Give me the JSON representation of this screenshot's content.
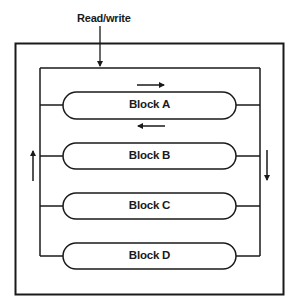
{
  "diagram": {
    "title_label": "Read/write",
    "blocks": [
      {
        "label": "Block A"
      },
      {
        "label": "Block B"
      },
      {
        "label": "Block C"
      },
      {
        "label": "Block D"
      }
    ],
    "arrows": [
      {
        "name": "read-write-arrow",
        "direction": "down"
      },
      {
        "name": "flow-right-arrow",
        "direction": "right"
      },
      {
        "name": "flow-left-arrow",
        "direction": "left"
      },
      {
        "name": "flow-up-arrow",
        "direction": "up"
      },
      {
        "name": "flow-down-arrow",
        "direction": "down"
      }
    ],
    "colors": {
      "stroke": "#1a1a1a",
      "background": "#ffffff"
    }
  }
}
